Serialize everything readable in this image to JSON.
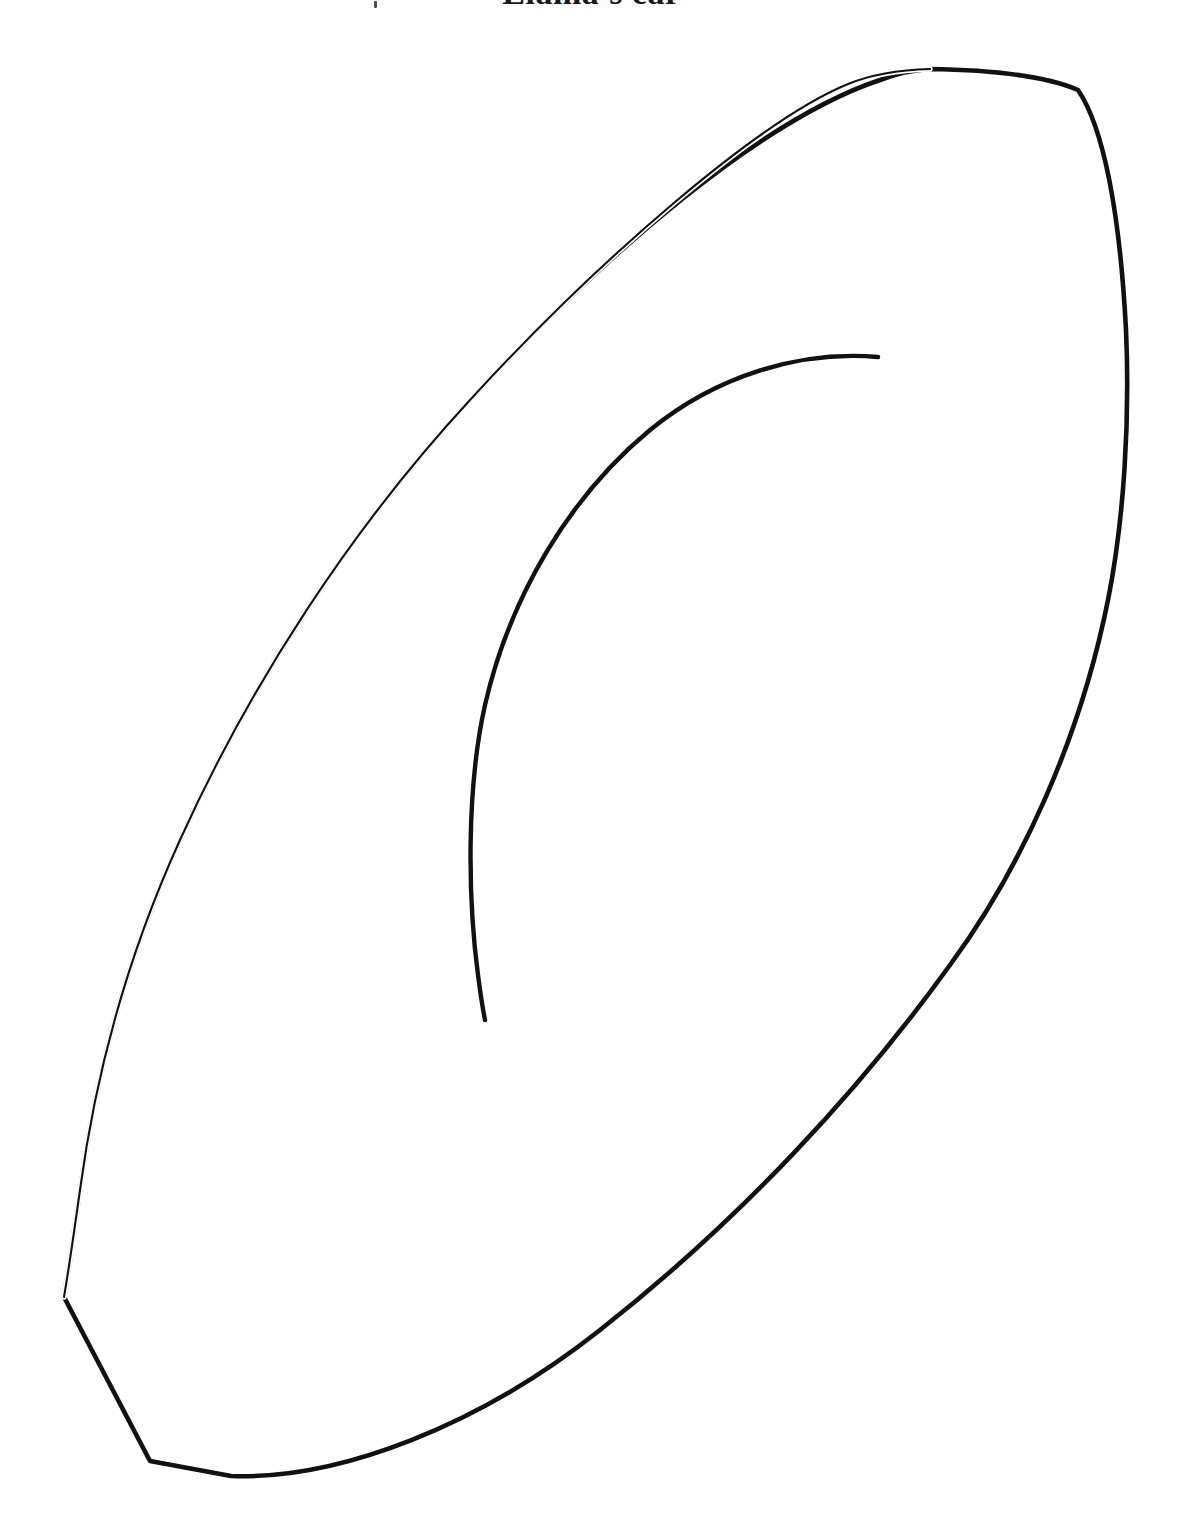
{
  "page": {
    "width": 1183,
    "height": 1536,
    "background_color": "#ffffff",
    "title": "Llama's ear",
    "title_color": "#1a1a1a",
    "title_clipped_at_top": true
  },
  "marks": {
    "speck_label": "",
    "speck_color": "#4a4a4a"
  },
  "artwork": {
    "name": "llama-ear-outline",
    "description": "Line-art coloring page template: large almond shaped llama ear outline with an inner C-shaped contour line",
    "stroke_color": "#111111",
    "fill_color": "none",
    "outer_outline_path": "M 930 69 C 1000 70 1050 78 1078 90 L 1078 90 C 1104 128 1120 215 1126 330 C 1130 420 1124 520 1108 600 C 1080 740 1020 870 950 965 C 860 1090 740 1220 600 1330 C 480 1425 340 1480 231 1476 L 150 1461 L 64 1297 C 70 1262 74 1232 80 1190 C 96 1070 130 950 180 840 C 250 685 350 530 470 400 C 600 258 760 120 880 80 C 896 74 913 70 930 69 Z",
    "inner_curve_path": "M 878 357 C 800 350 716 376 650 430 C 570 496 510 596 485 705 C 466 790 468 900 478 975 C 481 998 483 1010 485 1020",
    "outer_stroke_widths": {
      "thin_upper_left": 2.1,
      "thick_right_bottom": 4.6
    },
    "inner_stroke_width": 4.4,
    "key_points": {
      "top_vertex": [
        930,
        69
      ],
      "top_right_corner_vertex": [
        1078,
        90
      ],
      "rightmost": [
        1127,
        380
      ],
      "bottom_dip": [
        231,
        1476
      ],
      "bottom_left_vertex": [
        150,
        1461
      ],
      "left_vertex": [
        64,
        1297
      ],
      "inner_curve_top_end": [
        878,
        357
      ],
      "inner_curve_bottom_end": [
        485,
        1020
      ],
      "inner_curve_leftmost": [
        473,
        880
      ]
    }
  }
}
